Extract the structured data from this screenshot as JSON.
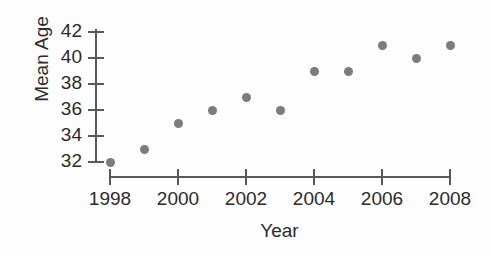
{
  "chart_data": {
    "type": "scatter",
    "title": "",
    "xlabel": "Year",
    "ylabel": "Mean Age",
    "x": [
      1998,
      1999,
      2000,
      2001,
      2002,
      2003,
      2004,
      2005,
      2006,
      2007,
      2008
    ],
    "values": [
      32,
      33,
      35,
      36,
      37,
      36,
      39,
      39,
      41,
      40,
      41
    ],
    "xlim": [
      1998,
      2008
    ],
    "ylim": [
      32,
      42
    ],
    "x_ticks": [
      1998,
      2000,
      2002,
      2004,
      2006,
      2008
    ],
    "x_tick_labels": [
      "1998",
      "2000",
      "2002",
      "2004",
      "2006",
      "2008"
    ],
    "y_ticks": [
      32,
      34,
      36,
      38,
      40,
      42
    ],
    "y_tick_labels": [
      "32",
      "34",
      "36",
      "38",
      "40",
      "42"
    ],
    "grid": false,
    "legend": null,
    "marker_color": "#7c7c7c",
    "axis_color": "#595959",
    "series": [
      {
        "name": "Mean Age",
        "points": [
          {
            "x": 1998,
            "y": 32
          },
          {
            "x": 1999,
            "y": 33
          },
          {
            "x": 2000,
            "y": 35
          },
          {
            "x": 2001,
            "y": 36
          },
          {
            "x": 2002,
            "y": 37
          },
          {
            "x": 2003,
            "y": 36
          },
          {
            "x": 2004,
            "y": 39
          },
          {
            "x": 2005,
            "y": 39
          },
          {
            "x": 2006,
            "y": 41
          },
          {
            "x": 2007,
            "y": 40
          },
          {
            "x": 2008,
            "y": 41
          }
        ]
      }
    ]
  }
}
